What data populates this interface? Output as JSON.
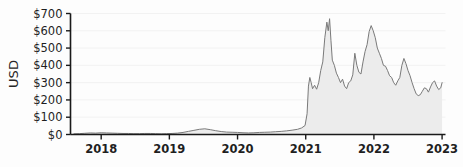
{
  "chart_data": {
    "type": "area",
    "title": "",
    "subtitle": "",
    "xlabel": "",
    "ylabel": "USD",
    "legend": [],
    "legend_position": "none",
    "grid": true,
    "grid_axis": "y",
    "xlim": [
      2017.55,
      2023.05
    ],
    "ylim": [
      0,
      700
    ],
    "y_ticks": [
      0,
      100,
      200,
      300,
      400,
      500,
      600,
      700
    ],
    "y_tick_labels": [
      "$0",
      "$100",
      "$200",
      "$300",
      "$400",
      "$500",
      "$600",
      "$700"
    ],
    "x_ticks": [
      2018,
      2019,
      2020,
      2021,
      2022,
      2023
    ],
    "x_tick_labels": [
      "2018",
      "2019",
      "2020",
      "2021",
      "2022",
      "2023"
    ],
    "line_color": "#7a7a7a",
    "fill_color": "#ececec",
    "axis_color": "#1a1a1a",
    "grid_color": "#f2f2f2",
    "background_color": "#fdfdfd",
    "series": [
      {
        "name": "USD",
        "x": [
          2017.6,
          2017.68,
          2017.76,
          2017.84,
          2017.92,
          2018.0,
          2018.08,
          2018.16,
          2018.24,
          2018.32,
          2018.4,
          2018.48,
          2018.56,
          2018.64,
          2018.72,
          2018.8,
          2018.88,
          2018.96,
          2019.04,
          2019.12,
          2019.2,
          2019.28,
          2019.36,
          2019.44,
          2019.52,
          2019.6,
          2019.68,
          2019.76,
          2019.84,
          2019.92,
          2020.0,
          2020.08,
          2020.16,
          2020.24,
          2020.32,
          2020.4,
          2020.48,
          2020.56,
          2020.64,
          2020.72,
          2020.8,
          2020.88,
          2020.94,
          2020.99,
          2021.02,
          2021.04,
          2021.06,
          2021.08,
          2021.1,
          2021.13,
          2021.16,
          2021.19,
          2021.22,
          2021.25,
          2021.28,
          2021.31,
          2021.33,
          2021.35,
          2021.37,
          2021.39,
          2021.42,
          2021.45,
          2021.48,
          2021.51,
          2021.54,
          2021.57,
          2021.6,
          2021.63,
          2021.66,
          2021.69,
          2021.72,
          2021.75,
          2021.78,
          2021.81,
          2021.84,
          2021.87,
          2021.9,
          2021.93,
          2021.96,
          2021.99,
          2022.02,
          2022.05,
          2022.08,
          2022.11,
          2022.14,
          2022.17,
          2022.2,
          2022.23,
          2022.26,
          2022.29,
          2022.32,
          2022.35,
          2022.38,
          2022.41,
          2022.44,
          2022.47,
          2022.5,
          2022.53,
          2022.56,
          2022.59,
          2022.62,
          2022.65,
          2022.68,
          2022.71,
          2022.74,
          2022.77,
          2022.8,
          2022.83,
          2022.86,
          2022.89,
          2022.92,
          2022.95,
          2022.98,
          2023.0
        ],
        "values": [
          4,
          5,
          7,
          9,
          8,
          10,
          9,
          8,
          7,
          6,
          6,
          5,
          5,
          6,
          6,
          5,
          4,
          5,
          6,
          8,
          12,
          18,
          24,
          30,
          33,
          28,
          22,
          17,
          14,
          13,
          12,
          10,
          9,
          10,
          12,
          13,
          14,
          16,
          18,
          21,
          25,
          30,
          38,
          52,
          120,
          280,
          330,
          300,
          265,
          285,
          262,
          300,
          370,
          420,
          560,
          650,
          600,
          670,
          545,
          430,
          400,
          355,
          330,
          300,
          320,
          280,
          265,
          300,
          310,
          345,
          470,
          400,
          360,
          350,
          420,
          480,
          520,
          595,
          630,
          600,
          560,
          500,
          470,
          440,
          400,
          395,
          370,
          340,
          330,
          300,
          285,
          310,
          330,
          400,
          440,
          410,
          370,
          340,
          300,
          265,
          235,
          225,
          230,
          250,
          270,
          265,
          245,
          275,
          300,
          310,
          280,
          260,
          270,
          300
        ]
      }
    ]
  }
}
